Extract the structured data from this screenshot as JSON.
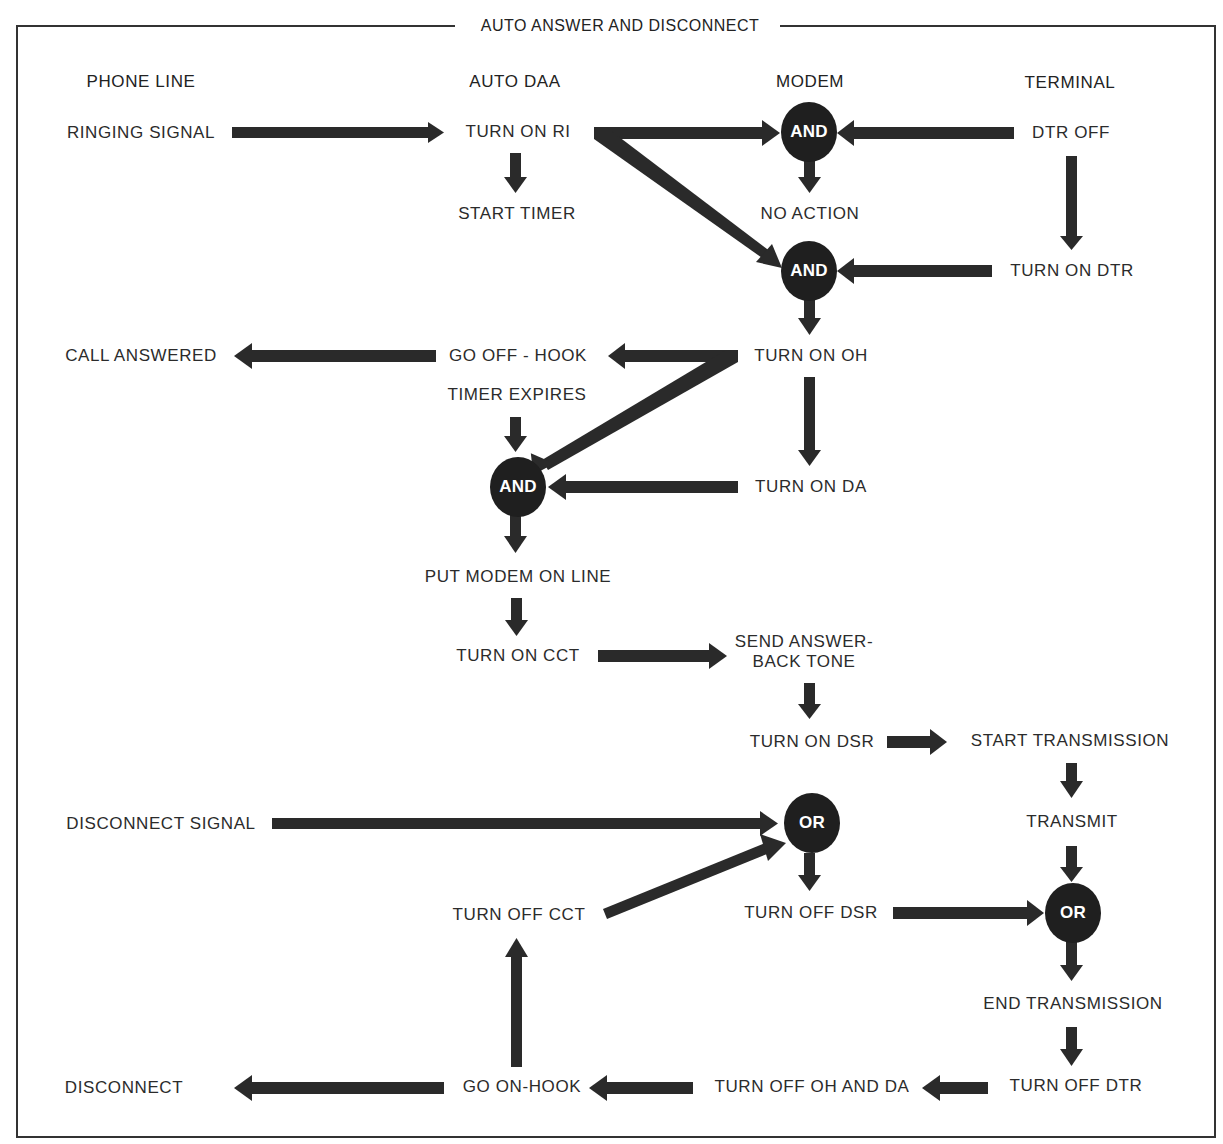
{
  "title": "AUTO ANSWER AND DISCONNECT",
  "columns": [
    {
      "id": "phone_line",
      "label": "PHONE LINE",
      "x": 141
    },
    {
      "id": "auto_daa",
      "label": "AUTO DAA",
      "x": 515
    },
    {
      "id": "modem",
      "label": "MODEM",
      "x": 810
    },
    {
      "id": "terminal",
      "label": "TERMINAL",
      "x": 1070
    }
  ],
  "nodes": {
    "ringing_signal": "RINGING SIGNAL",
    "turn_on_ri": "TURN ON RI",
    "start_timer": "START TIMER",
    "dtr_off": "DTR OFF",
    "no_action": "NO ACTION",
    "turn_on_dtr": "TURN ON DTR",
    "call_answered": "CALL ANSWERED",
    "go_off_hook": "GO OFF - HOOK",
    "turn_on_oh": "TURN ON OH",
    "timer_expires": "TIMER EXPIRES",
    "turn_on_da": "TURN ON DA",
    "put_modem_on_line": "PUT MODEM ON LINE",
    "turn_on_cct": "TURN ON CCT",
    "send_answer_back_tone": "SEND ANSWER-\nBACK TONE",
    "turn_on_dsr": "TURN ON DSR",
    "start_transmission": "START TRANSMISSION",
    "disconnect_signal": "DISCONNECT SIGNAL",
    "transmit": "TRANSMIT",
    "turn_off_cct": "TURN OFF CCT",
    "turn_off_dsr": "TURN OFF DSR",
    "end_transmission": "END TRANSMISSION",
    "disconnect": "DISCONNECT",
    "go_on_hook": "GO ON-HOOK",
    "turn_off_oh_and_da": "TURN OFF OH AND DA",
    "turn_off_dtr": "TURN OFF DTR"
  },
  "gates": {
    "and1": "AND",
    "and2": "AND",
    "and3": "AND",
    "or1": "OR",
    "or2": "OR"
  },
  "edges": [
    {
      "from": "RINGING SIGNAL",
      "to": "TURN ON RI"
    },
    {
      "from": "TURN ON RI",
      "to": "START TIMER"
    },
    {
      "from": "TURN ON RI",
      "to": "AND (modem, top)"
    },
    {
      "from": "TURN ON RI",
      "to": "AND (modem, middle)"
    },
    {
      "from": "DTR OFF",
      "to": "AND (modem, top)"
    },
    {
      "from": "AND (modem, top)",
      "to": "NO ACTION"
    },
    {
      "from": "DTR OFF",
      "to": "TURN ON DTR"
    },
    {
      "from": "TURN ON DTR",
      "to": "AND (modem, middle)"
    },
    {
      "from": "AND (modem, middle)",
      "to": "TURN ON OH"
    },
    {
      "from": "TURN ON OH",
      "to": "GO OFF - HOOK"
    },
    {
      "from": "GO OFF - HOOK",
      "to": "CALL ANSWERED"
    },
    {
      "from": "TURN ON OH",
      "to": "AND (auto daa)"
    },
    {
      "from": "TURN ON OH",
      "to": "TURN ON DA"
    },
    {
      "from": "TIMER EXPIRES",
      "to": "AND (auto daa)"
    },
    {
      "from": "TURN ON DA",
      "to": "AND (auto daa)"
    },
    {
      "from": "AND (auto daa)",
      "to": "PUT MODEM ON LINE"
    },
    {
      "from": "PUT MODEM ON LINE",
      "to": "TURN ON CCT"
    },
    {
      "from": "TURN ON CCT",
      "to": "SEND ANSWER-BACK TONE"
    },
    {
      "from": "SEND ANSWER-BACK TONE",
      "to": "TURN ON DSR"
    },
    {
      "from": "TURN ON DSR",
      "to": "START TRANSMISSION"
    },
    {
      "from": "START TRANSMISSION",
      "to": "TRANSMIT"
    },
    {
      "from": "DISCONNECT SIGNAL",
      "to": "OR (modem)"
    },
    {
      "from": "TURN OFF CCT",
      "to": "OR (modem)"
    },
    {
      "from": "OR (modem)",
      "to": "TURN OFF DSR"
    },
    {
      "from": "TRANSMIT",
      "to": "OR (terminal)"
    },
    {
      "from": "TURN OFF DSR",
      "to": "OR (terminal)"
    },
    {
      "from": "OR (terminal)",
      "to": "END TRANSMISSION"
    },
    {
      "from": "END TRANSMISSION",
      "to": "TURN OFF DTR"
    },
    {
      "from": "TURN OFF DTR",
      "to": "TURN OFF OH AND DA"
    },
    {
      "from": "TURN OFF OH AND DA",
      "to": "GO ON-HOOK"
    },
    {
      "from": "GO ON-HOOK",
      "to": "DISCONNECT"
    },
    {
      "from": "GO ON-HOOK",
      "to": "TURN OFF CCT"
    }
  ],
  "colors": {
    "arrow": "#2a2a2a",
    "gate_fill": "#1f1f1f",
    "gate_text": "#ffffff",
    "text": "#2b2b2b",
    "frame": "#333333",
    "background": "#ffffff"
  }
}
